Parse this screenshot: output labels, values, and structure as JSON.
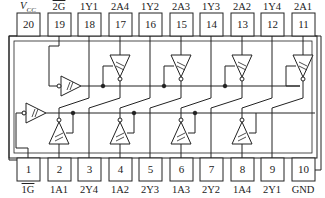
{
  "chip": {
    "description": "Octal inverting buffer with Schmitt-trigger inputs and two active-low enables (20-pin DIP)",
    "line_color": "#222222",
    "background": "#ffffff"
  },
  "top_pins": [
    {
      "number": "20",
      "label": "VCC",
      "label_main": "V",
      "label_sub": "CC"
    },
    {
      "number": "19",
      "label": "2G",
      "overline": true
    },
    {
      "number": "18",
      "label": "1Y1"
    },
    {
      "number": "17",
      "label": "2A4"
    },
    {
      "number": "16",
      "label": "1Y2"
    },
    {
      "number": "15",
      "label": "2A3"
    },
    {
      "number": "14",
      "label": "1Y3"
    },
    {
      "number": "13",
      "label": "2A2"
    },
    {
      "number": "12",
      "label": "1Y4"
    },
    {
      "number": "11",
      "label": "2A1"
    }
  ],
  "bottom_pins": [
    {
      "number": "1",
      "label": "1G",
      "overline": true
    },
    {
      "number": "2",
      "label": "1A1"
    },
    {
      "number": "3",
      "label": "2Y4"
    },
    {
      "number": "4",
      "label": "1A2"
    },
    {
      "number": "5",
      "label": "2Y3"
    },
    {
      "number": "6",
      "label": "1A3"
    },
    {
      "number": "7",
      "label": "2Y2"
    },
    {
      "number": "8",
      "label": "1A4"
    },
    {
      "number": "9",
      "label": "2Y1"
    },
    {
      "number": "10",
      "label": "GND"
    }
  ]
}
